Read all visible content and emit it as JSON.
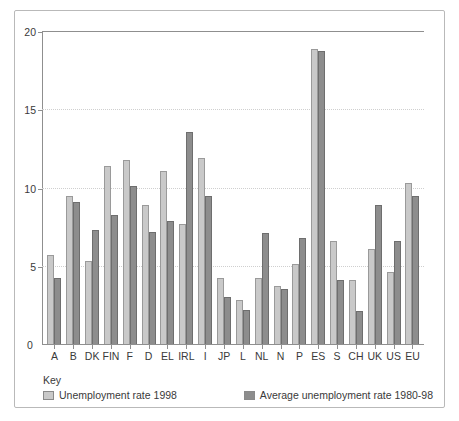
{
  "chart_data": {
    "type": "bar",
    "title": "",
    "subtitle": "",
    "xlabel": "",
    "ylabel": "",
    "ylim": [
      0,
      20
    ],
    "yticks": [
      0,
      5,
      10,
      15,
      20
    ],
    "ytick_labels": [
      "0",
      "5",
      "10",
      "15",
      "20"
    ],
    "grid": true,
    "legend_position": "below-plot",
    "legend_title": "Key",
    "categories": [
      "A",
      "B",
      "DK",
      "FIN",
      "F",
      "D",
      "EL",
      "IRL",
      "I",
      "JP",
      "L",
      "NL",
      "N",
      "P",
      "ES",
      "S",
      "CH",
      "UK",
      "US",
      "EU"
    ],
    "series": [
      {
        "name": "Unemployment rate 1998",
        "color": "#c9c9c9",
        "values": [
          5.7,
          9.5,
          5.3,
          11.4,
          11.8,
          8.9,
          11.1,
          7.7,
          11.9,
          4.2,
          2.8,
          4.2,
          3.7,
          5.1,
          18.9,
          6.6,
          4.1,
          6.1,
          4.6,
          10.3
        ]
      },
      {
        "name": "Average unemployment rate 1980-98",
        "color": "#8d8d8d",
        "values": [
          4.2,
          9.1,
          7.3,
          8.3,
          10.1,
          7.2,
          7.9,
          13.6,
          9.5,
          3.0,
          2.2,
          7.1,
          3.5,
          6.8,
          18.8,
          4.1,
          2.1,
          8.9,
          6.6,
          9.5
        ]
      }
    ]
  },
  "colors": {
    "series_light": "#c9c9c9",
    "series_dark": "#8d8d8d",
    "axis": "#8f8f8f",
    "grid": "#cfcfcf",
    "frame": "#b9b9b9",
    "text": "#3a3a3a"
  }
}
